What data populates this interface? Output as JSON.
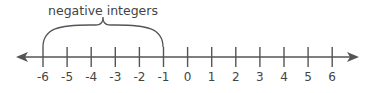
{
  "diagram": {
    "type": "number-line",
    "bracket_label": "negative integers",
    "bracket_range": [
      -6,
      -1
    ],
    "ticks": [
      "-6",
      "-5",
      "-4",
      "-3",
      "-2",
      "-1",
      "0",
      "1",
      "2",
      "3",
      "4",
      "5",
      "6"
    ],
    "colors": {
      "line": "#555555",
      "text": "#444444"
    }
  }
}
